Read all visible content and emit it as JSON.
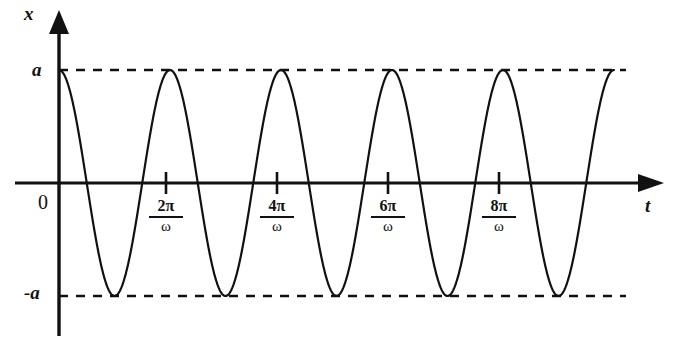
{
  "chart_data": {
    "type": "line",
    "title": "",
    "subtitle": "",
    "xlabel": "t",
    "ylabel": "x",
    "function": "x = a cos(ωt)",
    "amplitude_label": "a",
    "negative_amplitude_label": "-a",
    "origin_label": "0",
    "grid": false,
    "legend": null,
    "xlim": [
      0,
      11.2
    ],
    "ylim": [
      -1.35,
      1.45
    ],
    "x_unit": "π/ω",
    "y_ticks": [
      {
        "value": 1,
        "label": "a"
      },
      {
        "value": 0,
        "label": "0"
      },
      {
        "value": -1,
        "label": "-a"
      }
    ],
    "x_ticks": [
      {
        "value": 2,
        "numerator": "2π",
        "denominator": "ω",
        "label": "2π/ω"
      },
      {
        "value": 4,
        "numerator": "4π",
        "denominator": "ω",
        "label": "4π/ω"
      },
      {
        "value": 6,
        "numerator": "6π",
        "denominator": "ω",
        "label": "6π/ω"
      },
      {
        "value": 8,
        "numerator": "8π",
        "denominator": "ω",
        "label": "8π/ω"
      }
    ],
    "series": [
      {
        "name": "x(t)",
        "color": "#111111",
        "x": [
          0.0,
          0.1,
          0.2,
          0.3,
          0.4,
          0.5,
          0.6,
          0.7,
          0.8,
          0.9,
          1.0,
          1.1,
          1.2,
          1.3,
          1.4,
          1.5,
          1.6,
          1.7,
          1.8,
          1.9,
          2.0,
          2.1,
          2.2,
          2.3,
          2.4,
          2.5,
          2.6,
          2.7,
          2.8,
          2.9,
          3.0,
          3.1,
          3.2,
          3.3,
          3.4,
          3.5,
          3.6,
          3.7,
          3.8,
          3.9,
          4.0,
          4.1,
          4.2,
          4.3,
          4.4,
          4.5,
          4.6,
          4.7,
          4.8,
          4.9,
          5.0,
          5.1,
          5.2,
          5.3,
          5.4,
          5.5,
          5.6,
          5.7,
          5.8,
          5.9,
          6.0,
          6.1,
          6.2,
          6.3,
          6.4,
          6.5,
          6.6,
          6.7,
          6.8,
          6.9,
          7.0,
          7.1,
          7.2,
          7.3,
          7.4,
          7.5,
          7.6,
          7.7,
          7.8,
          7.9,
          8.0,
          8.1,
          8.2,
          8.3,
          8.4,
          8.5,
          8.6,
          8.7,
          8.8,
          8.9,
          9.0,
          9.1,
          9.2,
          9.3,
          9.4,
          9.5,
          9.6,
          9.7,
          9.8,
          9.9,
          10.0
        ],
        "y_formula": "cos(pi * x)",
        "amplitude": 1,
        "period": 2,
        "phase": 0
      }
    ],
    "dashed_reference_lines": [
      {
        "y": 1,
        "label": "a",
        "style": "dashed"
      },
      {
        "y": -1,
        "label": "-a",
        "style": "dashed"
      }
    ],
    "axes_arrows": [
      "x-up",
      "t-right"
    ],
    "cycles_shown": 5
  }
}
